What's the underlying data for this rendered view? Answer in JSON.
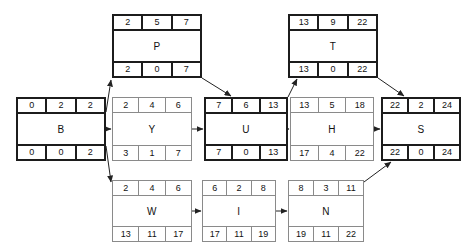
{
  "diagram": {
    "type": "activity-on-node-network",
    "legend": {
      "top_row_fields": [
        "early_start",
        "duration",
        "early_finish"
      ],
      "bottom_row_fields": [
        "late_start",
        "slack",
        "late_finish"
      ]
    },
    "critical_path": [
      "B",
      "P",
      "U",
      "T",
      "S"
    ],
    "nodes": [
      {
        "id": "P",
        "name": "P",
        "critical": true,
        "top": [
          "2",
          "5",
          "7"
        ],
        "bottom": [
          "2",
          "0",
          "7"
        ],
        "x": 112,
        "y": 14,
        "w": 90,
        "h": 64
      },
      {
        "id": "T",
        "name": "T",
        "critical": true,
        "top": [
          "13",
          "9",
          "22"
        ],
        "bottom": [
          "13",
          "0",
          "22"
        ],
        "x": 288,
        "y": 14,
        "w": 90,
        "h": 64
      },
      {
        "id": "B",
        "name": "B",
        "critical": true,
        "top": [
          "0",
          "2",
          "2"
        ],
        "bottom": [
          "0",
          "0",
          "2"
        ],
        "x": 16,
        "y": 97,
        "w": 90,
        "h": 64
      },
      {
        "id": "Y",
        "name": "Y",
        "critical": false,
        "top": [
          "2",
          "4",
          "6"
        ],
        "bottom": [
          "3",
          "1",
          "7"
        ],
        "x": 112,
        "y": 97,
        "w": 80,
        "h": 64
      },
      {
        "id": "U",
        "name": "U",
        "critical": true,
        "top": [
          "7",
          "6",
          "13"
        ],
        "bottom": [
          "7",
          "0",
          "13"
        ],
        "x": 204,
        "y": 97,
        "w": 84,
        "h": 64
      },
      {
        "id": "H",
        "name": "H",
        "critical": false,
        "top": [
          "13",
          "5",
          "18"
        ],
        "bottom": [
          "17",
          "4",
          "22"
        ],
        "x": 290,
        "y": 97,
        "w": 84,
        "h": 64
      },
      {
        "id": "S",
        "name": "S",
        "critical": true,
        "top": [
          "22",
          "2",
          "24"
        ],
        "bottom": [
          "22",
          "0",
          "24"
        ],
        "x": 381,
        "y": 97,
        "w": 80,
        "h": 64
      },
      {
        "id": "W",
        "name": "W",
        "critical": false,
        "top": [
          "2",
          "4",
          "6"
        ],
        "bottom": [
          "13",
          "11",
          "17"
        ],
        "x": 112,
        "y": 180,
        "w": 80,
        "h": 62
      },
      {
        "id": "I",
        "name": "I",
        "critical": false,
        "top": [
          "6",
          "2",
          "8"
        ],
        "bottom": [
          "17",
          "11",
          "19"
        ],
        "x": 202,
        "y": 180,
        "w": 74,
        "h": 62
      },
      {
        "id": "N",
        "name": "N",
        "critical": false,
        "top": [
          "8",
          "3",
          "11"
        ],
        "bottom": [
          "19",
          "11",
          "22"
        ],
        "x": 288,
        "y": 180,
        "w": 76,
        "h": 62
      }
    ],
    "edges": [
      {
        "from": "B",
        "to": "P",
        "shape": "diagonal-up"
      },
      {
        "from": "B",
        "to": "Y",
        "shape": "horizontal"
      },
      {
        "from": "B",
        "to": "W",
        "shape": "diagonal-down"
      },
      {
        "from": "P",
        "to": "U",
        "shape": "diagonal-down"
      },
      {
        "from": "Y",
        "to": "U",
        "shape": "horizontal"
      },
      {
        "from": "U",
        "to": "T",
        "shape": "diagonal-up"
      },
      {
        "from": "U",
        "to": "H",
        "shape": "horizontal"
      },
      {
        "from": "W",
        "to": "I",
        "shape": "horizontal"
      },
      {
        "from": "I",
        "to": "N",
        "shape": "horizontal"
      },
      {
        "from": "T",
        "to": "S",
        "shape": "diagonal-down"
      },
      {
        "from": "H",
        "to": "S",
        "shape": "horizontal"
      },
      {
        "from": "N",
        "to": "S",
        "shape": "diagonal-up"
      }
    ]
  }
}
